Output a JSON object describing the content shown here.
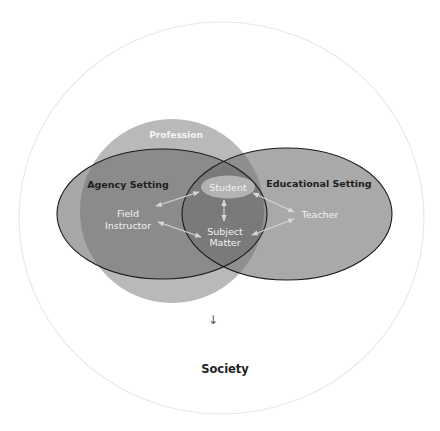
{
  "caption": "",
  "diagram": {
    "outer": {
      "label": "Society"
    },
    "profession": {
      "label": "Profession"
    },
    "agency_setting": {
      "label": "Agency Setting"
    },
    "educational_setting": {
      "label": "Educational Setting"
    },
    "nodes": {
      "student": "Student",
      "field_instructor_line1": "Field",
      "field_instructor_line2": "Instructor",
      "subject_matter_line1": "Subject",
      "subject_matter_line2": "Matter",
      "teacher": "Teacher"
    },
    "down_arrow": "↓",
    "relationships": [
      {
        "from": "Field Instructor",
        "to": "Student",
        "type": "bidirectional"
      },
      {
        "from": "Field Instructor",
        "to": "Subject Matter",
        "type": "bidirectional"
      },
      {
        "from": "Student",
        "to": "Subject Matter",
        "type": "bidirectional"
      },
      {
        "from": "Student",
        "to": "Teacher",
        "type": "bidirectional"
      },
      {
        "from": "Subject Matter",
        "to": "Teacher",
        "type": "bidirectional"
      }
    ],
    "colors": {
      "outer_stroke": "#e6e6e6",
      "profession_fill": "#b8b8b8",
      "agency_fill": "#8c8c8c",
      "educational_fill": "#8c8c8c",
      "student_fill": "#b2b2b2",
      "ellipse_stroke": "#1a1a1a",
      "arrow": "#d6d6d6"
    }
  }
}
